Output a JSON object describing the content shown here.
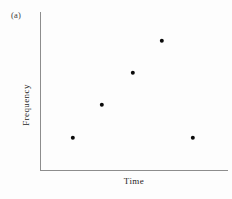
{
  "figure": {
    "panel_label": "(a)",
    "background_color": "#fdfdfd",
    "axis_color": "#8d8d8d",
    "marker_color": "#0a0a0a",
    "width_px": 232,
    "height_px": 199
  },
  "chart_data": {
    "type": "scatter",
    "title": "(a)",
    "xlabel": "Time",
    "ylabel": "Frequency",
    "grid": false,
    "legend": null,
    "xlim": [
      0,
      6
    ],
    "ylim": [
      0,
      5
    ],
    "axis_ticks": {
      "x": [],
      "y": []
    },
    "series": [
      {
        "name": "Frequency over time",
        "marker": "filled-circle",
        "color": "#0a0a0a",
        "x": [
          1,
          2,
          3,
          4,
          5
        ],
        "y": [
          1,
          2,
          3,
          4,
          1
        ],
        "points": [
          {
            "x": 1,
            "y": 1,
            "px": 73,
            "py": 138
          },
          {
            "x": 2,
            "y": 2,
            "px": 102,
            "py": 105
          },
          {
            "x": 3,
            "y": 3,
            "px": 133,
            "py": 73
          },
          {
            "x": 4,
            "y": 4,
            "px": 162,
            "py": 41
          },
          {
            "x": 5,
            "y": 1,
            "px": 193,
            "py": 138
          }
        ]
      }
    ],
    "annotations": []
  }
}
